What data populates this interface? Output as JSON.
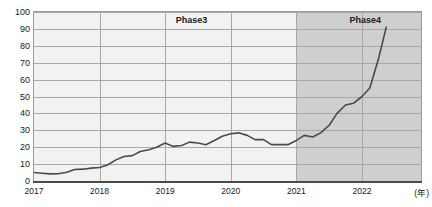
{
  "chart_data": {
    "type": "line",
    "title": "",
    "xlabel": "(年)",
    "ylabel": "",
    "xlim": [
      2017,
      2022.9
    ],
    "ylim": [
      0,
      100
    ],
    "grid": true,
    "legend": "none",
    "x_tick_labels": [
      "2017",
      "2018",
      "2019",
      "2020",
      "2021",
      "2022"
    ],
    "x_tick_values": [
      2017,
      2018,
      2019,
      2020,
      2021,
      2022
    ],
    "y_tick_labels": [
      "0",
      "10",
      "20",
      "30",
      "40",
      "50",
      "60",
      "70",
      "80",
      "90",
      "100"
    ],
    "y_tick_values": [
      0,
      10,
      20,
      30,
      40,
      50,
      60,
      70,
      80,
      90,
      100
    ],
    "unit_label": "(年)",
    "annotations": [
      {
        "text": "Phase3",
        "x": 2019.4,
        "y": 95
      },
      {
        "text": "Phase4",
        "x": 2022.05,
        "y": 95
      }
    ],
    "shaded_regions": [
      {
        "label": "Phase3",
        "x_start": 2017,
        "x_end": 2021,
        "color": "#f2f2f2"
      },
      {
        "label": "Phase4",
        "x_start": 2021,
        "x_end": 2022.9,
        "color": "#cfcfcf"
      }
    ],
    "series": [
      {
        "name": "value",
        "color": "#4a4a4a",
        "x": [
          2017.0,
          2017.12,
          2017.25,
          2017.37,
          2017.5,
          2017.62,
          2017.75,
          2017.87,
          2018.0,
          2018.12,
          2018.25,
          2018.37,
          2018.5,
          2018.62,
          2018.75,
          2018.87,
          2019.0,
          2019.12,
          2019.25,
          2019.37,
          2019.5,
          2019.62,
          2019.75,
          2019.87,
          2020.0,
          2020.12,
          2020.25,
          2020.37,
          2020.5,
          2020.62,
          2020.75,
          2020.87,
          2021.0,
          2021.12,
          2021.25,
          2021.37,
          2021.5,
          2021.62,
          2021.75,
          2021.87,
          2022.0,
          2022.12,
          2022.25,
          2022.37
        ],
        "y": [
          5.0,
          4.6,
          4.2,
          4.3,
          5.2,
          6.8,
          7.0,
          7.6,
          8.0,
          9.5,
          12.5,
          14.5,
          15.0,
          17.5,
          18.5,
          20.0,
          22.5,
          20.5,
          21.0,
          23.0,
          22.5,
          21.5,
          24.0,
          26.5,
          28.0,
          28.5,
          27.0,
          24.5,
          24.5,
          21.5,
          21.5,
          21.5,
          24.0,
          27.0,
          26.0,
          28.5,
          33.0,
          40.0,
          45.0,
          46.0,
          50.0,
          55.0,
          72.0,
          91.0
        ]
      }
    ]
  }
}
